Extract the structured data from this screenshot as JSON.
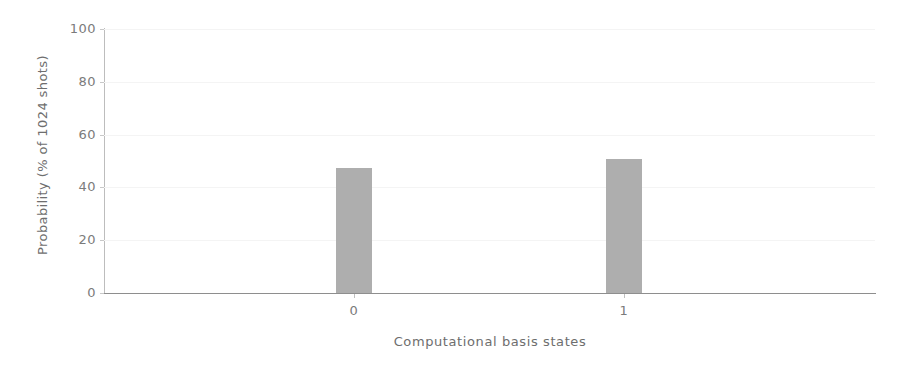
{
  "chart_data": {
    "type": "bar",
    "title": "",
    "subtitle": "",
    "xlabel": "Computational basis states",
    "ylabel": "Probability (% of 1024 shots)",
    "categories": [
      "0",
      "1"
    ],
    "values": [
      47.3,
      50.8
    ],
    "ylim": [
      0,
      100
    ],
    "yticks": [
      0,
      20,
      40,
      60,
      80,
      100
    ],
    "ytick_labels": [
      "0",
      "20",
      "40",
      "60",
      "80",
      "100"
    ],
    "xtick_labels": [
      "0",
      "1"
    ],
    "grid": true,
    "grid_axis": "y",
    "legend": null,
    "legend_position": "none",
    "bar_color": "#aeaeae",
    "grid_color": "#f4f4f4",
    "axis_color": "#8e8e8e",
    "text_color": "#7b7b7b",
    "background": "#ffffff",
    "bar_width_px": 36,
    "annotations": []
  }
}
